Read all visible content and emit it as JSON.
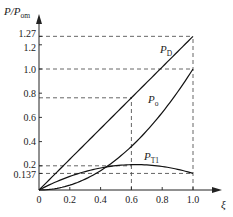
{
  "chart_data": {
    "type": "line",
    "title": "",
    "xlabel": "ξ",
    "ylabel": "P/P_om",
    "xlim": [
      0,
      1.0
    ],
    "ylim": [
      0,
      1.35
    ],
    "x_ticks": [
      "0",
      "0.2",
      "0.4",
      "0.6",
      "0.8",
      "1.0"
    ],
    "y_ticks": [
      "0.137",
      "0.2",
      "0.4",
      "0.6",
      "0.8",
      "1.0",
      "1.2",
      "1.27"
    ],
    "grid": false,
    "legend": "inline labels",
    "series": [
      {
        "name": "P_D",
        "label_main": "P",
        "label_sub": "D",
        "x": [
          0,
          0.2,
          0.4,
          0.6,
          0.8,
          1.0
        ],
        "y": [
          0,
          0.254,
          0.508,
          0.762,
          1.016,
          1.27
        ]
      },
      {
        "name": "P_o",
        "label_main": "P",
        "label_sub": "o",
        "x": [
          0,
          0.2,
          0.4,
          0.6,
          0.8,
          1.0
        ],
        "y": [
          0,
          0.04,
          0.16,
          0.36,
          0.64,
          1.0
        ]
      },
      {
        "name": "P_T1",
        "label_main": "P",
        "label_sub": "T1",
        "x": [
          0,
          0.2,
          0.4,
          0.6,
          0.8,
          1.0
        ],
        "y": [
          0,
          0.107,
          0.178,
          0.2,
          0.178,
          0.137
        ]
      }
    ],
    "reference_lines": [
      {
        "type": "h",
        "y": 1.27,
        "x_to": 1.0
      },
      {
        "type": "h",
        "y": 1.0,
        "x_to": 1.0
      },
      {
        "type": "h",
        "y": 0.762,
        "x_to": 0.6
      },
      {
        "type": "h",
        "y": 0.2,
        "x_to": 0.6
      },
      {
        "type": "h",
        "y": 0.137,
        "x_to": 1.0
      },
      {
        "type": "v",
        "x": 0.6,
        "y_to": 0.762
      },
      {
        "type": "v",
        "x": 1.0,
        "y_to": 1.27
      }
    ]
  },
  "axis": {
    "y_label_main": "P/P",
    "y_label_sub": "om",
    "x_label": "ξ",
    "origin": "0"
  }
}
